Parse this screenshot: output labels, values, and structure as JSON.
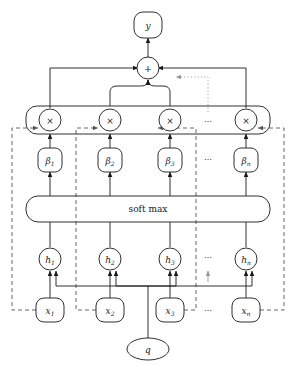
{
  "figure": {
    "type": "neural-attention-architecture-diagram",
    "background_color": "#ffffff",
    "stroke_color": "#1a1a1a",
    "dashed_color": "#555555",
    "dotted_color": "#9a9a9a"
  },
  "nodes": {
    "output": {
      "label": "y",
      "shape": "rounded-rect"
    },
    "sum": {
      "label": "+",
      "shape": "circle"
    },
    "softmax": {
      "label": "soft max",
      "shape": "rounded-rect-wide"
    },
    "query": {
      "label": "q",
      "shape": "ellipse"
    }
  },
  "ellipsis": {
    "label": "⋯"
  },
  "rows": {
    "product": {
      "name": "product-row",
      "items": [
        {
          "label": "×"
        },
        {
          "label": "×"
        },
        {
          "label": "×"
        },
        {
          "label": "×"
        }
      ]
    },
    "weights": {
      "name": "beta-row",
      "items": [
        {
          "base": "β",
          "sub": "1",
          "full": "β₁"
        },
        {
          "base": "β",
          "sub": "2",
          "full": "β₂"
        },
        {
          "base": "β",
          "sub": "3",
          "full": "β₃"
        },
        {
          "base": "β",
          "sub": "n",
          "full": "βₙ"
        }
      ]
    },
    "hidden": {
      "name": "h-row",
      "items": [
        {
          "base": "h",
          "sub": "1",
          "full": "h₁"
        },
        {
          "base": "h",
          "sub": "2",
          "full": "h₂"
        },
        {
          "base": "h",
          "sub": "3",
          "full": "h₃"
        },
        {
          "base": "h",
          "sub": "n",
          "full": "hₙ"
        }
      ]
    },
    "inputs": {
      "name": "x-row",
      "items": [
        {
          "base": "x",
          "sub": "1",
          "full": "x₁"
        },
        {
          "base": "x",
          "sub": "2",
          "full": "x₂"
        },
        {
          "base": "x",
          "sub": "3",
          "full": "x₃"
        },
        {
          "base": "x",
          "sub": "n",
          "full": "xₙ"
        }
      ]
    }
  },
  "layout": {
    "columns_x": [
      50,
      110,
      170,
      246
    ],
    "ellipsis_x": 208,
    "row_y": {
      "output": 24,
      "sum": 68,
      "product": 120,
      "beta": 158,
      "softmax": 208,
      "hidden": 259,
      "inputs": 310,
      "query": 349
    }
  }
}
